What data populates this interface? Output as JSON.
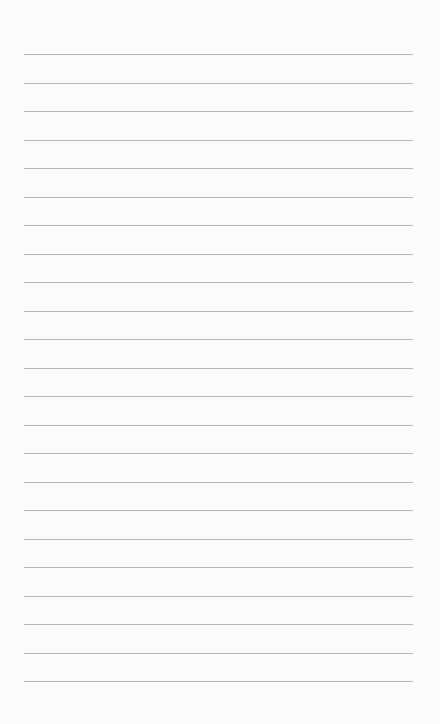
{
  "paper": {
    "type": "lined-notepaper",
    "line_count": 23,
    "first_line_y": 54,
    "line_spacing": 28.5,
    "line_left": 24,
    "line_width": 389,
    "line_color": "#b8b8b8",
    "background_color": "#fbfbfa"
  }
}
